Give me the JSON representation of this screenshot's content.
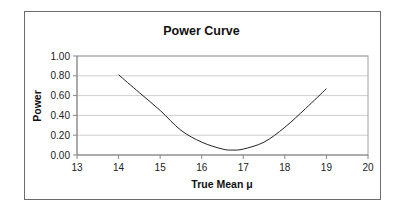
{
  "chart_data": {
    "type": "line",
    "title": "Power Curve",
    "xlabel": "True Mean μ",
    "ylabel": "Power",
    "xlim": [
      13,
      20
    ],
    "ylim": [
      0,
      1
    ],
    "x_ticks": [
      "13",
      "14",
      "15",
      "16",
      "17",
      "18",
      "19",
      "20"
    ],
    "y_ticks": [
      "0.00",
      "0.20",
      "0.40",
      "0.60",
      "0.80",
      "1.00"
    ],
    "grid": "horizontal",
    "legend": "none",
    "series": [
      {
        "name": "Power",
        "x": [
          14,
          14.5,
          15,
          15.5,
          16,
          16.5,
          16.75,
          17,
          17.5,
          18,
          18.5,
          19
        ],
        "values": [
          0.81,
          0.63,
          0.45,
          0.25,
          0.13,
          0.06,
          0.05,
          0.06,
          0.13,
          0.28,
          0.47,
          0.67
        ]
      }
    ],
    "colors": {
      "line": "#222222",
      "grid": "#cfcfcf",
      "axis": "#888888"
    }
  }
}
